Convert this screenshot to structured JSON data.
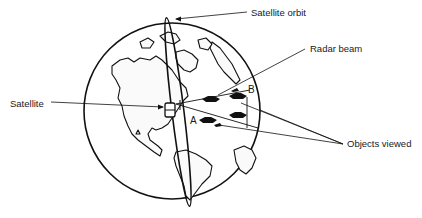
{
  "figure": {
    "type": "labeled-illustration",
    "labels": {
      "orbit": "Satellite orbit",
      "beam": "Radar beam",
      "satellite": "Satellite",
      "objects": "Objects viewed"
    },
    "point_labels": {
      "a": "A",
      "b": "B"
    },
    "objects_count": 4,
    "colors": {
      "ink": "#111111",
      "background": "#ffffff"
    }
  }
}
